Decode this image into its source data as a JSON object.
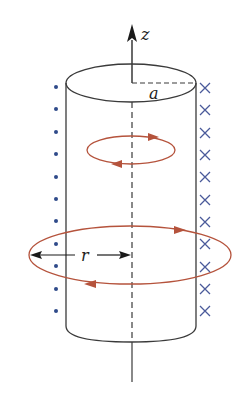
{
  "diagram": {
    "labels": {
      "axis": "z",
      "radius_a": "a",
      "radius_r": "r"
    },
    "colors": {
      "outline": "#3a3a3a",
      "loop": "#b5533c",
      "dot": "#2f4a8a",
      "cross": "#4a5a9a",
      "background": "#ffffff"
    },
    "left_side_symbol": "dot (out of page)",
    "right_side_symbol": "cross (into page)",
    "dot_count": 11,
    "cross_count": 11,
    "loops": [
      {
        "name": "inner-loop",
        "position": "inside cylinder"
      },
      {
        "name": "outer-loop",
        "position": "outside cylinder, radius r"
      }
    ]
  }
}
